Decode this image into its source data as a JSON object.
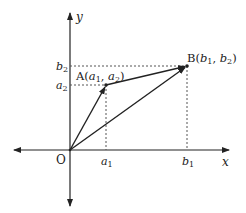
{
  "diagram": {
    "axes": {
      "x_label": "x",
      "y_label": "y",
      "origin_label": "O"
    },
    "points": {
      "A": {
        "name": "A",
        "coord_text": "(a1, a2)",
        "x1": "a",
        "x1_sub": "1",
        "x2": "a",
        "x2_sub": "2"
      },
      "B": {
        "name": "B",
        "coord_text": "(b1, b2)",
        "x1": "b",
        "x1_sub": "1",
        "x2": "b",
        "x2_sub": "2"
      }
    },
    "tick_labels": {
      "a1": {
        "base": "a",
        "sub": "1"
      },
      "b1": {
        "base": "b",
        "sub": "1"
      },
      "a2": {
        "base": "a",
        "sub": "2"
      },
      "b2": {
        "base": "b",
        "sub": "2"
      }
    },
    "colors": {
      "line": "#222222",
      "dotted": "#555555",
      "background": "#ffffff"
    }
  }
}
